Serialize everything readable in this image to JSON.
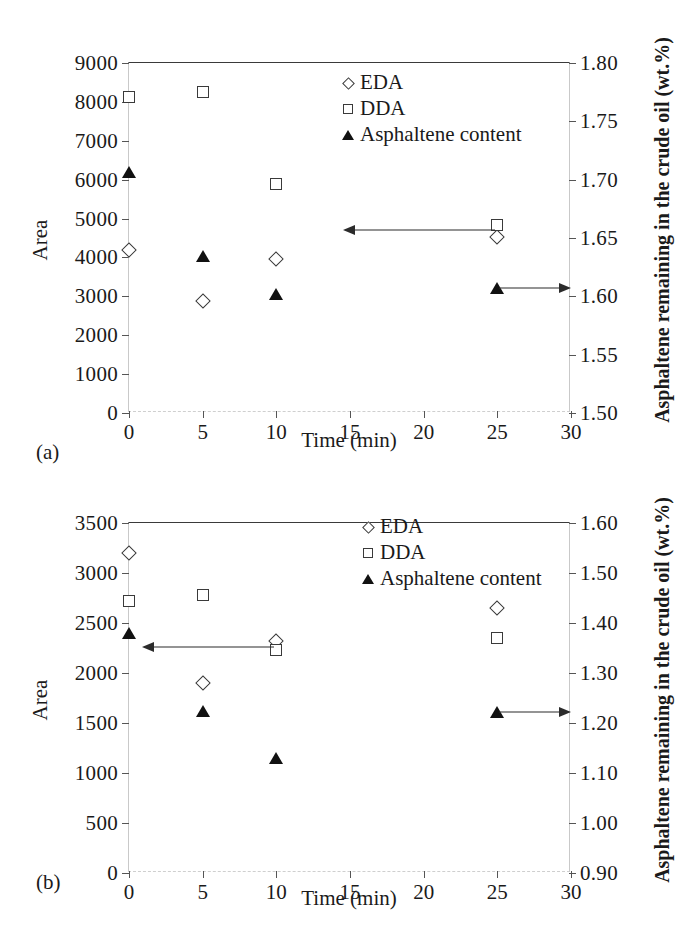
{
  "figure": {
    "panels": [
      {
        "caption": "(a)"
      },
      {
        "caption": "(b)"
      }
    ]
  },
  "chart_data": [
    {
      "panel": "(a)",
      "type": "scatter",
      "title": "",
      "xlabel": "Time (min)",
      "ylabel": "Area",
      "y2label": "Asphaltene remaining in the crude oil (wt.%)",
      "xlim": [
        0,
        30
      ],
      "ylim": [
        0,
        9000
      ],
      "y2lim": [
        1.5,
        1.8
      ],
      "xticks": [
        0,
        5,
        10,
        15,
        20,
        25,
        30
      ],
      "xticklabels": [
        "0",
        "5",
        "10",
        "15",
        "20",
        "25",
        "30"
      ],
      "yticks": [
        0,
        1000,
        2000,
        3000,
        4000,
        5000,
        6000,
        7000,
        8000,
        9000
      ],
      "yticklabels": [
        "0",
        "1000",
        "2000",
        "3000",
        "4000",
        "5000",
        "6000",
        "7000",
        "8000",
        "9000"
      ],
      "y2ticks": [
        1.5,
        1.55,
        1.6,
        1.65,
        1.7,
        1.75,
        1.8
      ],
      "y2ticklabels": [
        "1.50",
        "1.55",
        "1.60",
        "1.65",
        "1.70",
        "1.75",
        "1.80"
      ],
      "grid": false,
      "legend_position": "upper-center-right",
      "series": [
        {
          "name": "EDA",
          "marker": "open-diamond",
          "axis": "left",
          "x": [
            0,
            5,
            10,
            25
          ],
          "values": [
            4200,
            2890,
            3960,
            4520
          ]
        },
        {
          "name": "DDA",
          "marker": "open-square",
          "axis": "left",
          "x": [
            0,
            5,
            10,
            25
          ],
          "values": [
            8130,
            8250,
            5880,
            4840
          ]
        },
        {
          "name": "Asphaltene content",
          "marker": "filled-triangle",
          "axis": "right",
          "x": [
            0,
            5,
            10,
            25
          ],
          "values": [
            1.707,
            1.635,
            1.602,
            1.607
          ]
        }
      ],
      "annotations": [
        {
          "name": "left-arrow",
          "direction": "left",
          "from_x": 25,
          "to_x": 14.5,
          "at_y": 4700,
          "axis": "left"
        },
        {
          "name": "right-arrow",
          "direction": "right",
          "from_x": 25,
          "to_x": 30,
          "at_y": 1.607,
          "axis": "right"
        }
      ]
    },
    {
      "panel": "(b)",
      "type": "scatter",
      "title": "",
      "xlabel": "Time (min)",
      "ylabel": "Area",
      "y2label": "Asphaltene remaining in the crude oil (wt.%)",
      "xlim": [
        0,
        30
      ],
      "ylim": [
        0,
        3500
      ],
      "y2lim": [
        0.9,
        1.6
      ],
      "xticks": [
        0,
        5,
        10,
        15,
        20,
        25,
        30
      ],
      "xticklabels": [
        "0",
        "5",
        "10",
        "15",
        "20",
        "25",
        "30"
      ],
      "yticks": [
        0,
        500,
        1000,
        1500,
        2000,
        2500,
        3000,
        3500
      ],
      "yticklabels": [
        "0",
        "500",
        "1000",
        "1500",
        "2000",
        "2500",
        "3000",
        "3500"
      ],
      "y2ticks": [
        0.9,
        1.0,
        1.1,
        1.2,
        1.3,
        1.4,
        1.5,
        1.6
      ],
      "y2ticklabels": [
        "0.90",
        "1.00",
        "1.10",
        "1.20",
        "1.30",
        "1.40",
        "1.50",
        "1.60"
      ],
      "grid": false,
      "legend_position": "upper-center-right",
      "series": [
        {
          "name": "EDA",
          "marker": "open-diamond",
          "axis": "left",
          "x": [
            0,
            5,
            10,
            25
          ],
          "values": [
            3200,
            1900,
            2320,
            2650
          ]
        },
        {
          "name": "DDA",
          "marker": "open-square",
          "axis": "left",
          "x": [
            0,
            5,
            10,
            25
          ],
          "values": [
            2720,
            2780,
            2235,
            2350
          ]
        },
        {
          "name": "Asphaltene content",
          "marker": "filled-triangle",
          "axis": "right",
          "x": [
            0,
            5,
            10,
            25
          ],
          "values": [
            1.38,
            1.225,
            1.13,
            1.222
          ]
        }
      ],
      "annotations": [
        {
          "name": "left-arrow",
          "direction": "left",
          "from_x": 10,
          "to_x": 0.9,
          "at_y": 2265,
          "axis": "left"
        },
        {
          "name": "right-arrow",
          "direction": "right",
          "from_x": 25,
          "to_x": 30,
          "at_y": 1.222,
          "axis": "right"
        }
      ]
    }
  ],
  "legend": {
    "entries": [
      {
        "label": "EDA",
        "marker": "open-diamond"
      },
      {
        "label": "DDA",
        "marker": "open-square"
      },
      {
        "label": "Asphaltene content",
        "marker": "filled-triangle"
      }
    ]
  },
  "colors": {
    "axis": "#3a3a3a",
    "marker_outline": "#3a3a3a",
    "marker_fill": "#111111",
    "background": "#ffffff"
  }
}
